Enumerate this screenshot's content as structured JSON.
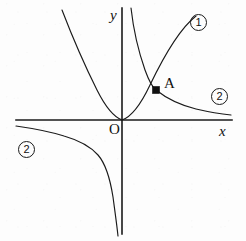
{
  "figure": {
    "kind": "coordinate-plane-graph",
    "background_color": "#fdfdfd",
    "ink_color": "#1a1a1a",
    "width": 246,
    "height": 241
  },
  "axes": {
    "x_label": "x",
    "y_label": "y",
    "origin_label": "O",
    "origin_px": {
      "x": 122,
      "y": 120
    },
    "x_axis_span_px": {
      "x1": 16,
      "x2": 232,
      "y": 120
    },
    "y_axis_span_px": {
      "x": 122,
      "y1": 8,
      "y2": 234
    },
    "ticks": [],
    "gridlines": false
  },
  "curves": [
    {
      "id": "curve-1",
      "label": "①",
      "label_text": "1",
      "type": "parabola",
      "equation": "y = a x^2",
      "vertex_px": {
        "x": 122,
        "y": 120
      },
      "description": "upward opening parabola with vertex at the origin",
      "label_position_px": {
        "x": 190,
        "y": 14
      }
    },
    {
      "id": "curve-2-quadrant-1",
      "label": "②",
      "label_text": "2",
      "type": "hyperbola-branch",
      "equation": "y = k / x",
      "quadrant": 1,
      "description": "first quadrant branch of inverse proportion, asymptotic to both axes",
      "label_position_px": {
        "x": 211,
        "y": 88
      }
    },
    {
      "id": "curve-2-quadrant-3",
      "label": "②",
      "label_text": "2",
      "type": "hyperbola-branch",
      "equation": "y = k / x",
      "quadrant": 3,
      "description": "third quadrant branch of inverse proportion, asymptotic to both axes",
      "label_position_px": {
        "x": 18,
        "y": 141
      }
    }
  ],
  "points": [
    {
      "id": "point-a",
      "label": "A",
      "marker": "filled-square",
      "position_px": {
        "x": 156,
        "y": 90
      },
      "label_position_px": {
        "x": 164,
        "y": 76
      },
      "description": "intersection of curve 1 and the first quadrant branch of curve 2"
    }
  ]
}
